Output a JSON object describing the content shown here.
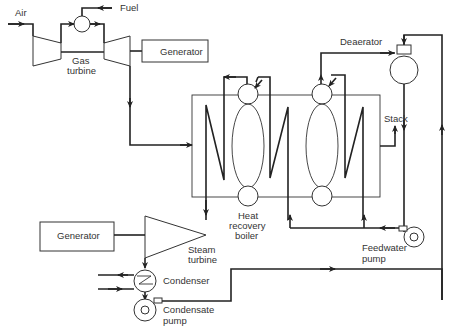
{
  "diagram": {
    "type": "combined-cycle power plant schematic",
    "labels": {
      "air": "Air",
      "fuel": "Fuel",
      "gas_turbine_1": "Gas",
      "gas_turbine_2": "turbine",
      "generator_top": "Generator",
      "deaerator": "Deaerator",
      "stack": "Stack",
      "hrb_1": "Heat",
      "hrb_2": "recovery",
      "hrb_3": "boiler",
      "generator_bottom": "Generator",
      "steam_turbine_1": "Steam",
      "steam_turbine_2": "turbine",
      "condenser": "Condenser",
      "condensate_pump_1": "Condensate",
      "condensate_pump_2": "pump",
      "feedwater_pump_1": "Feedwater",
      "feedwater_pump_2": "pump"
    },
    "components": [
      "Gas turbine compressor",
      "Combustor",
      "Gas turbine",
      "Generator (gas turbine)",
      "Heat recovery boiler",
      "Deaerator",
      "Stack",
      "Feedwater pump",
      "Steam turbine",
      "Generator (steam turbine)",
      "Condenser",
      "Condensate pump"
    ],
    "line_color": "#222222",
    "background": "#ffffff"
  }
}
